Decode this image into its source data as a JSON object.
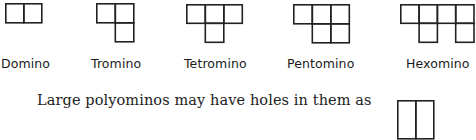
{
  "figure": {
    "stroke_color": "#222222",
    "cell_size": 18.5,
    "shapes": [
      {
        "name": "Domino",
        "cells": [
          [
            0,
            0
          ],
          [
            1,
            0
          ]
        ]
      },
      {
        "name": "Tromino",
        "cells": [
          [
            0,
            0
          ],
          [
            1,
            0
          ],
          [
            1,
            1
          ]
        ]
      },
      {
        "name": "Tetromino",
        "cells": [
          [
            0,
            0
          ],
          [
            1,
            0
          ],
          [
            2,
            0
          ],
          [
            1,
            1
          ]
        ]
      },
      {
        "name": "Pentomino",
        "cells": [
          [
            0,
            0
          ],
          [
            1,
            0
          ],
          [
            2,
            0
          ],
          [
            1,
            1
          ],
          [
            2,
            1
          ]
        ]
      },
      {
        "name": "Hexomino",
        "cells": [
          [
            0,
            0
          ],
          [
            1,
            0
          ],
          [
            2,
            0
          ],
          [
            3,
            0
          ],
          [
            1,
            1
          ],
          [
            3,
            1
          ]
        ]
      }
    ],
    "labels": {
      "domino": "Domino",
      "tromino": "Tromino",
      "tetromino": "Tetromino",
      "pentomino": "Pentomino",
      "hexomino": "Hexomino"
    }
  },
  "body": {
    "text": "Large polyominos may have holes in them as"
  }
}
